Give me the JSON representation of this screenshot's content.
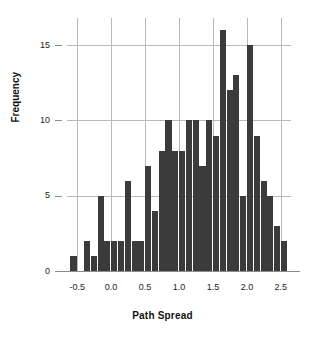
{
  "chart_data": {
    "type": "bar",
    "title": "",
    "subtitle": "",
    "xlabel": "Path Spread",
    "ylabel": "Frequency",
    "xlim": [
      -0.65,
      2.65
    ],
    "ylim": [
      0,
      16.8
    ],
    "grid": true,
    "legend": null,
    "bin_width": 0.1,
    "bar_color": "#3b3b3b",
    "grid_color": "#b9b9b9",
    "axis_color": "#8c8c8c",
    "xticks": [
      "-0.5",
      "0.0",
      "0.5",
      "1.0",
      "1.5",
      "2.0",
      "2.5"
    ],
    "xtick_values": [
      -0.5,
      0.0,
      0.5,
      1.0,
      1.5,
      2.0,
      2.5
    ],
    "yticks": [
      "0",
      "5",
      "10",
      "15"
    ],
    "ytick_values": [
      0,
      5,
      10,
      15
    ],
    "bin_left_edges": [
      -0.6,
      -0.5,
      -0.4,
      -0.3,
      -0.2,
      -0.1,
      0.0,
      0.1,
      0.2,
      0.3,
      0.4,
      0.5,
      0.6,
      0.7,
      0.8,
      0.9,
      1.0,
      1.1,
      1.2,
      1.3,
      1.4,
      1.5,
      1.6,
      1.7,
      1.8,
      1.9,
      2.0,
      2.1,
      2.2,
      2.3,
      2.4,
      2.5
    ],
    "values": [
      1,
      0,
      2,
      1,
      5,
      2,
      2,
      2,
      6,
      2,
      2,
      7,
      4,
      8,
      10,
      8,
      8,
      10,
      10,
      7,
      10,
      9,
      16,
      12,
      13,
      5,
      15,
      9,
      6,
      5,
      3,
      2
    ],
    "categories": [
      "-0.6",
      "-0.5",
      "-0.4",
      "-0.3",
      "-0.2",
      "-0.1",
      "0.0",
      "0.1",
      "0.2",
      "0.3",
      "0.4",
      "0.5",
      "0.6",
      "0.7",
      "0.8",
      "0.9",
      "1.0",
      "1.1",
      "1.2",
      "1.3",
      "1.4",
      "1.5",
      "1.6",
      "1.7",
      "1.8",
      "1.9",
      "2.0",
      "2.1",
      "2.2",
      "2.3",
      "2.4",
      "2.5"
    ]
  }
}
